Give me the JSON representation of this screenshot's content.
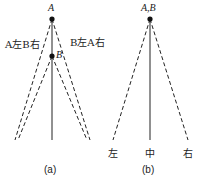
{
  "panel_a": {
    "point_a_label": "A",
    "point_b_label": "B",
    "left_annotation": "A左B右",
    "right_annotation": "B左A右",
    "caption": "(a)"
  },
  "panel_b": {
    "apex_label": "A,B",
    "left_label": "左",
    "center_label": "中",
    "right_label": "右",
    "caption": "(b)"
  },
  "colors": {
    "line": "#222222",
    "background": "#ffffff"
  }
}
